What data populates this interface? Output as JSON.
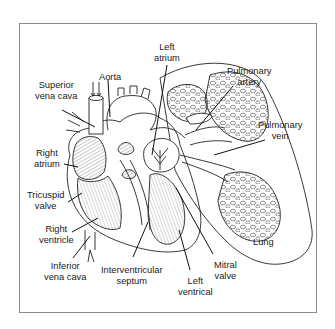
{
  "diagram": {
    "labels": {
      "superior_vena_cava": "Superior\nvena cava",
      "aorta": "Aorta",
      "left_atrium": "Left\natrium",
      "pulmonary_artery": "Pulmonary\nartery",
      "pulmonary_vein": "Pulmonary\nvein",
      "right_atrium": "Right\natrium",
      "tricuspid_valve": "Tricuspid\nvalve",
      "right_ventricle": "Right\nventricle",
      "inferior_vena_cava": "Inferior\nvena cava",
      "interventricular_septum": "Interventricular\nseptum",
      "left_ventrical": "Left\nventrical",
      "mitral_valve": "Mitral\nvalve",
      "lung": "Lung"
    },
    "colors": {
      "line": "#222222",
      "frame": "#8a8a8a",
      "hatch": "#6a6a6a"
    }
  }
}
